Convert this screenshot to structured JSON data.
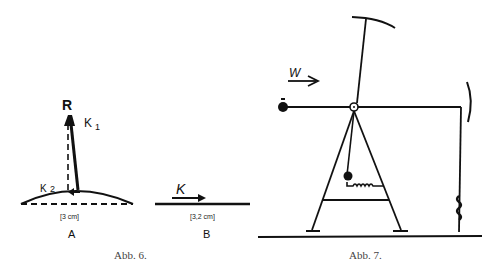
{
  "fig6": {
    "caption": "Abb. 6.",
    "panelA": {
      "label_R": "R",
      "label_K1": "K",
      "label_K1_sub": "1",
      "label_K2": "K",
      "label_K2_sub": "2",
      "measure": "[3 cm]",
      "panel_label": "A"
    },
    "panelB": {
      "label_K": "K",
      "measure": "[3,2 cm]",
      "panel_label": "B"
    }
  },
  "fig7": {
    "caption": "Abb. 7.",
    "label_W": "W"
  }
}
